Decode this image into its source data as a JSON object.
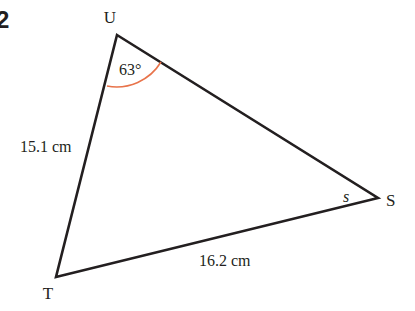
{
  "question_number": "2",
  "diagram": {
    "type": "triangle",
    "vertices": {
      "U": {
        "label": "U",
        "x": 117,
        "y": 35
      },
      "S": {
        "label": "S",
        "x": 378,
        "y": 198
      },
      "T": {
        "label": "T",
        "x": 56,
        "y": 277
      }
    },
    "sides": {
      "UT": {
        "label": "15.1 cm"
      },
      "TS": {
        "label": "16.2 cm"
      }
    },
    "angles": {
      "U": {
        "label": "63°",
        "marker_color": "#e8734a"
      },
      "S": {
        "label": "s"
      }
    },
    "line_color": "#231f20"
  }
}
